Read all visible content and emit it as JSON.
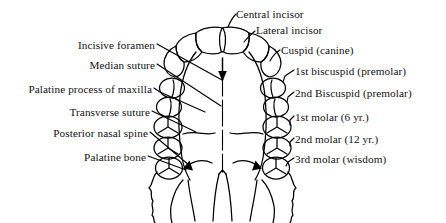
{
  "figure": {
    "ink_color": "#000000",
    "background_color": "#ffffff"
  },
  "labels_left": [
    {
      "text": "Incisive foramen",
      "x": 155,
      "y": 46
    },
    {
      "text": "Median suture",
      "x": 155,
      "y": 66
    },
    {
      "text": "Palatine process of maxilla",
      "x": 152,
      "y": 90
    },
    {
      "text": "Transverse suture",
      "x": 150,
      "y": 113
    },
    {
      "text": "Posterior nasal spine",
      "x": 148,
      "y": 134
    },
    {
      "text": "Palatine bone",
      "x": 146,
      "y": 158
    }
  ],
  "labels_right": [
    {
      "text": "Central incisor",
      "x": 236,
      "y": 14
    },
    {
      "text": "Lateral incisor",
      "x": 256,
      "y": 30
    },
    {
      "text": "Cuspid (canine)",
      "x": 281,
      "y": 50
    },
    {
      "text": "1st biscuspid (premolar)",
      "x": 295,
      "y": 72
    },
    {
      "text": "2nd Biscuspid (premolar)",
      "x": 295,
      "y": 94
    },
    {
      "text": "1st molar (6 yr.)",
      "x": 295,
      "y": 118
    },
    {
      "text": "2nd molar (12 yr.)",
      "x": 295,
      "y": 140
    },
    {
      "text": "3rd molar (wisdom)",
      "x": 295,
      "y": 160
    }
  ]
}
